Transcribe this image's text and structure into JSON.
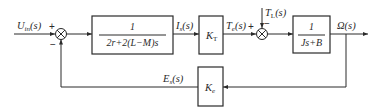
{
  "diagram": {
    "type": "control-block-diagram",
    "input": {
      "label": "U",
      "sub": "in",
      "arg": "(s)"
    },
    "sum1": {
      "plus": "+",
      "minus": "−"
    },
    "block1": {
      "numerator": "1",
      "denominator": "2r+2(L−M)s"
    },
    "signal_is": {
      "label": "I",
      "sub": "s",
      "arg": "(s)"
    },
    "block_kt": {
      "label": "K",
      "sub": "T"
    },
    "signal_te": {
      "label": "T",
      "sub": "e",
      "arg": "(s)"
    },
    "sum2": {
      "plus": "+",
      "minus": "−"
    },
    "disturbance": {
      "label": "T",
      "sub": "L",
      "arg": "(s)"
    },
    "block3": {
      "numerator": "1",
      "denominator": "Js+B"
    },
    "output": {
      "label": "Ω(s)"
    },
    "feedback_block": {
      "label": "K",
      "sub": "e"
    },
    "feedback_signal": {
      "label": "E",
      "sub": "s",
      "arg": "(s)"
    }
  }
}
